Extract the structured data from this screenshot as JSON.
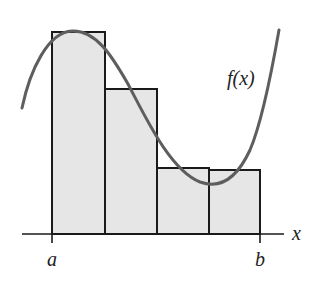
{
  "diagram": {
    "function_label": "f(x)",
    "axis_label": "x",
    "left_endpoint_label": "a",
    "right_endpoint_label": "b",
    "num_rectangles": 4,
    "rectangles": [
      {
        "index": 1,
        "x": 52,
        "width": 53,
        "top": 32
      },
      {
        "index": 2,
        "x": 105,
        "width": 52,
        "top": 89
      },
      {
        "index": 3,
        "x": 157,
        "width": 52,
        "top": 168
      },
      {
        "index": 4,
        "x": 209,
        "width": 51,
        "top": 170
      }
    ],
    "colors": {
      "rect_fill": "#e6e6e6",
      "rect_stroke": "#1a1a1a",
      "curve": "#5e5e5e",
      "axis": "#1a1a1a",
      "text": "#222222"
    }
  }
}
